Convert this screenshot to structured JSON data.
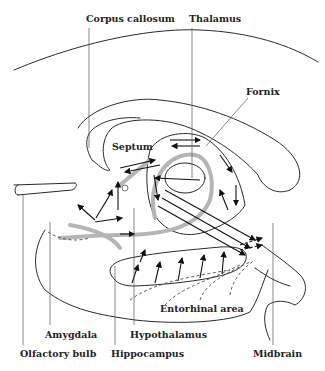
{
  "diagram": {
    "type": "anatomical-pathway",
    "labels": {
      "corpus_callosum": "Corpus callosum",
      "thalamus": "Thalamus",
      "fornix": "Fornix",
      "septum": "Septum",
      "entorhinal_area": "Entorhinal area",
      "amygdala": "Amygdala",
      "hypothalamus": "Hypothalamus",
      "olfactory_bulb": "Olfactory bulb",
      "hippocampus": "Hippocampus",
      "midbrain": "Midbrain"
    },
    "colors": {
      "line": "#2a2a2a",
      "fiber_tract": "#b5b5b5",
      "background": "#ffffff"
    }
  }
}
